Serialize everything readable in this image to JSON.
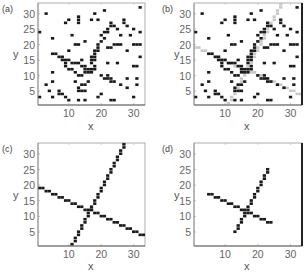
{
  "figure": {
    "panels": [
      "(a)",
      "(b)",
      "(c)",
      "(d)"
    ]
  },
  "chart_data": [
    {
      "type": "scatter",
      "panel_label": "(a)",
      "title": "",
      "xlabel": "x",
      "ylabel": "y",
      "xlim": [
        0.5,
        33.5
      ],
      "ylim": [
        0.5,
        33.5
      ],
      "xticks": [
        10,
        20,
        30
      ],
      "yticks": [
        5,
        10,
        15,
        20,
        25,
        30
      ],
      "grid": false,
      "marker": "filled square cell",
      "points": [
        [
          3,
          30
        ],
        [
          1,
          24
        ],
        [
          5,
          22
        ],
        [
          9,
          27
        ],
        [
          10,
          28
        ],
        [
          13,
          27
        ],
        [
          13,
          28
        ],
        [
          13,
          29
        ],
        [
          18,
          30
        ],
        [
          21,
          31
        ],
        [
          32,
          32
        ],
        [
          17,
          28
        ],
        [
          19,
          28
        ],
        [
          23,
          27
        ],
        [
          24,
          26
        ],
        [
          27,
          27
        ],
        [
          27,
          28
        ],
        [
          28,
          26
        ],
        [
          22,
          25
        ],
        [
          23,
          26
        ],
        [
          25,
          25
        ],
        [
          30,
          25
        ],
        [
          32,
          24
        ],
        [
          11,
          23
        ],
        [
          20,
          23
        ],
        [
          21,
          24
        ],
        [
          22,
          24
        ],
        [
          26,
          23
        ],
        [
          29,
          23
        ],
        [
          12,
          20
        ],
        [
          13,
          20
        ],
        [
          15,
          21
        ],
        [
          19,
          20
        ],
        [
          20,
          21
        ],
        [
          21,
          22
        ],
        [
          23,
          19
        ],
        [
          24,
          20
        ],
        [
          25,
          20
        ],
        [
          26,
          20
        ],
        [
          30,
          20
        ],
        [
          31,
          20
        ],
        [
          32,
          20
        ],
        [
          10,
          18
        ],
        [
          18,
          17
        ],
        [
          18,
          18
        ],
        [
          19,
          18
        ],
        [
          19,
          19
        ],
        [
          22,
          19
        ],
        [
          28,
          18
        ],
        [
          32,
          16
        ],
        [
          5,
          17
        ],
        [
          6,
          17
        ],
        [
          7,
          16
        ],
        [
          8,
          16
        ],
        [
          8,
          15
        ],
        [
          9,
          15
        ],
        [
          10,
          15
        ],
        [
          11,
          14
        ],
        [
          12,
          14
        ],
        [
          13,
          14
        ],
        [
          14,
          15
        ],
        [
          14,
          13
        ],
        [
          15,
          13
        ],
        [
          15,
          12
        ],
        [
          16,
          12
        ],
        [
          16,
          11
        ],
        [
          17,
          11
        ],
        [
          17,
          12
        ],
        [
          18,
          12
        ],
        [
          17,
          14
        ],
        [
          17,
          15
        ],
        [
          17,
          16
        ],
        [
          18,
          15
        ],
        [
          18,
          16
        ],
        [
          18,
          13
        ],
        [
          9,
          13
        ],
        [
          9,
          14
        ],
        [
          10,
          12
        ],
        [
          11,
          12
        ],
        [
          12,
          11
        ],
        [
          5,
          11
        ],
        [
          22,
          14
        ],
        [
          25,
          14
        ],
        [
          30,
          13
        ],
        [
          31,
          13
        ],
        [
          13,
          10
        ],
        [
          14,
          10
        ],
        [
          20,
          10
        ],
        [
          21,
          9
        ],
        [
          22,
          9
        ],
        [
          22,
          10
        ],
        [
          23,
          9
        ],
        [
          23,
          8
        ],
        [
          24,
          8
        ],
        [
          26,
          7
        ],
        [
          28,
          9
        ],
        [
          31,
          9
        ],
        [
          3,
          7
        ],
        [
          5,
          8
        ],
        [
          14,
          7
        ],
        [
          15,
          7
        ],
        [
          13,
          5
        ],
        [
          13,
          6
        ],
        [
          14,
          5
        ],
        [
          15,
          5
        ],
        [
          28,
          6
        ],
        [
          31,
          7
        ],
        [
          4,
          5
        ],
        [
          7,
          5
        ],
        [
          7,
          4
        ],
        [
          8,
          4
        ],
        [
          9,
          3
        ],
        [
          1,
          3
        ],
        [
          5,
          3
        ],
        [
          10,
          2
        ],
        [
          13,
          2
        ],
        [
          15,
          2
        ],
        [
          19,
          3
        ],
        [
          20,
          4
        ],
        [
          23,
          2
        ],
        [
          24,
          2
        ],
        [
          30,
          3
        ],
        [
          16,
          8
        ],
        [
          12,
          8
        ],
        [
          15,
          11
        ]
      ],
      "lines": []
    },
    {
      "type": "scatter",
      "panel_label": "(b)",
      "title": "",
      "xlabel": "x",
      "ylabel": "y",
      "xlim": [
        0.5,
        33.5
      ],
      "ylim": [
        0.5,
        33.5
      ],
      "xticks": [
        10,
        20,
        30
      ],
      "yticks": [
        5,
        10,
        15,
        20,
        25,
        30
      ],
      "grid": false,
      "marker": "filled square cell",
      "points": "same as panel (a)",
      "lines": [
        {
          "name": "detected line 1 (gray overlay)",
          "color": "#c8c8c8",
          "x": [
            1,
            33
          ],
          "y": [
            19,
            4
          ]
        },
        {
          "name": "detected line 2 (gray overlay)",
          "color": "#c8c8c8",
          "x": [
            10.5,
            27
          ],
          "y": [
            0.5,
            33
          ]
        }
      ]
    },
    {
      "type": "scatter",
      "panel_label": "(c)",
      "title": "",
      "xlabel": "x",
      "ylabel": "y",
      "xlim": [
        0.5,
        33.5
      ],
      "ylim": [
        0.5,
        33.5
      ],
      "xticks": [
        10,
        20,
        30
      ],
      "yticks": [
        5,
        10,
        15,
        20,
        25,
        30
      ],
      "grid": false,
      "marker": "filled square cell",
      "lines": [
        {
          "name": "line 1",
          "x": [
            1,
            33
          ],
          "y": [
            19,
            4
          ]
        },
        {
          "name": "line 2",
          "x": [
            11,
            27
          ],
          "y": [
            1,
            33
          ]
        }
      ]
    },
    {
      "type": "scatter",
      "panel_label": "(d)",
      "title": "",
      "xlabel": "x",
      "ylabel": "y",
      "xlim": [
        0.5,
        33.5
      ],
      "ylim": [
        0.5,
        33.5
      ],
      "xticks": [
        10,
        20,
        30
      ],
      "yticks": [
        5,
        10,
        15,
        20,
        25,
        30
      ],
      "grid": false,
      "marker": "filled square cell",
      "lines": [
        {
          "name": "segment 1",
          "x": [
            5,
            24
          ],
          "y": [
            17,
            8
          ]
        },
        {
          "name": "segment 2",
          "x": [
            13,
            23
          ],
          "y": [
            5,
            25
          ]
        }
      ]
    }
  ],
  "layout": {
    "panels": [
      {
        "left": 38,
        "top": 3,
        "w": 107,
        "h": 102,
        "label_x": 2,
        "label_y": 2,
        "ylabel_x": 13,
        "ylabel_y": 49,
        "xlabel_x": 88,
        "xlabel_y": 122,
        "right_bar": false
      },
      {
        "left": 194,
        "top": 3,
        "w": 108,
        "h": 102,
        "label_x": 162,
        "label_y": 2,
        "ylabel_x": 174,
        "ylabel_y": 49,
        "xlabel_x": 244,
        "xlabel_y": 122,
        "right_bar": true
      },
      {
        "left": 38,
        "top": 143,
        "w": 107,
        "h": 103,
        "label_x": 2,
        "label_y": 142,
        "ylabel_x": 13,
        "ylabel_y": 190,
        "xlabel_x": 88,
        "xlabel_y": 262,
        "right_bar": false
      },
      {
        "left": 194,
        "top": 143,
        "w": 108,
        "h": 103,
        "label_x": 162,
        "label_y": 142,
        "ylabel_x": 174,
        "ylabel_y": 190,
        "xlabel_x": 244,
        "xlabel_y": 262,
        "right_bar": true
      }
    ]
  }
}
